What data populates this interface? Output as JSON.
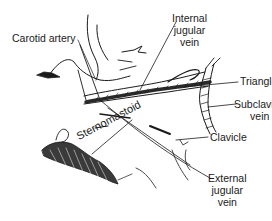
{
  "figure": {
    "labels": {
      "carotid_artery": "Carotid artery",
      "internal_jugular_vein": "Internal\njugular\nvein",
      "triangle": "Triangle",
      "subclavian_vein": "Subclavian\nvein",
      "clavicle": "Clavicle",
      "external_jugular_vein": "External\njugular\nvein",
      "sternomastoid": "Sternomastoid"
    },
    "colors": {
      "ink": "#1a1a1a",
      "background": "#ffffff"
    }
  }
}
